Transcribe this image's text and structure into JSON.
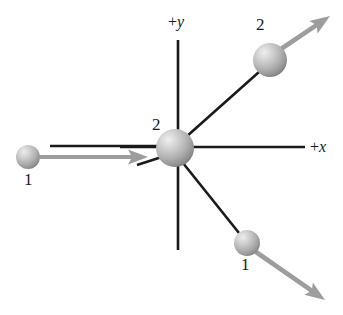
{
  "figure": {
    "background_color": "#ffffff",
    "line_color": "#1a1a1a",
    "arrow_color": "#9a9a9a",
    "sphere_light_color": "#e6e6e6",
    "sphere_mid_color": "#b0b0b0",
    "sphere_dark_color": "#7a7a7a"
  },
  "axes": {
    "y_axis": {
      "label": "+y",
      "sign": "+",
      "name": "y",
      "x": 178,
      "y_top": 40,
      "y_bottom": 250,
      "label_x": 168,
      "label_y": 14
    },
    "x_axis": {
      "label": "+x",
      "sign": "+",
      "name": "x",
      "y": 147,
      "x_left": 120,
      "x_right": 305,
      "label_x": 310,
      "label_y": 139
    }
  },
  "particles": [
    {
      "id": "incoming-particle-1",
      "label": "1",
      "cx": 28,
      "cy": 157,
      "r": 12,
      "label_x": 24,
      "label_y": 171
    },
    {
      "id": "target-particle-2",
      "label": "2",
      "cx": 175,
      "cy": 148,
      "r": 19,
      "label_x": 152,
      "label_y": 116
    },
    {
      "id": "outgoing-particle-2",
      "label": "2",
      "cx": 270,
      "cy": 60,
      "r": 17,
      "label_x": 256,
      "label_y": 16
    },
    {
      "id": "outgoing-particle-1",
      "label": "1",
      "cx": 247,
      "cy": 243,
      "r": 13,
      "label_x": 241,
      "label_y": 256
    }
  ],
  "velocity_arrows": [
    {
      "id": "incoming-velocity-1",
      "from_x": 40,
      "from_y": 157,
      "to_x": 148,
      "to_y": 157
    },
    {
      "id": "outgoing-velocity-2",
      "from_x": 281,
      "from_y": 49,
      "to_x": 330,
      "to_y": 16
    },
    {
      "id": "outgoing-velocity-1",
      "from_x": 256,
      "from_y": 252,
      "to_x": 325,
      "to_y": 300
    }
  ],
  "trajectory_lines": [
    {
      "id": "incoming-path-1",
      "x1": 50,
      "y1": 146,
      "x2": 163,
      "y2": 146
    },
    {
      "id": "deflection-path-1",
      "x1": 137,
      "y1": 165,
      "x2": 168,
      "y2": 155
    },
    {
      "id": "outgoing-path-2",
      "x1": 186,
      "y1": 137,
      "x2": 259,
      "y2": 72
    },
    {
      "id": "outgoing-path-1",
      "x1": 183,
      "y1": 163,
      "x2": 239,
      "y2": 233
    }
  ]
}
